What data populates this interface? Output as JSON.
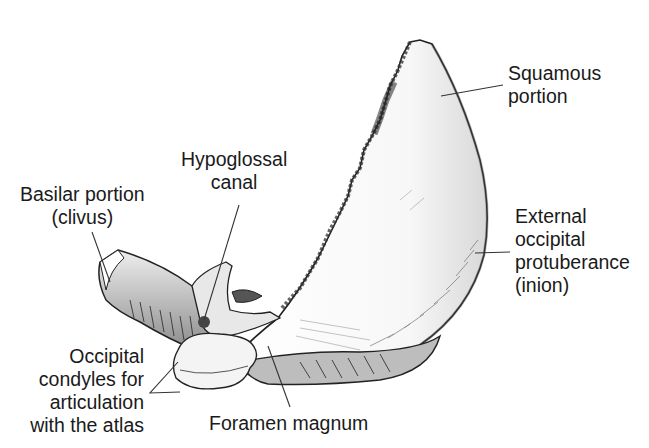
{
  "figure": {
    "labels": {
      "squamous": [
        "Squamous",
        "portion"
      ],
      "hypoglossal": [
        "Hypoglossal",
        "canal"
      ],
      "basilar": [
        "Basilar portion",
        "(clivus)"
      ],
      "external_occipital": [
        "External",
        "occipital",
        "protuberance",
        "(inion)"
      ],
      "condyles": [
        "Occipital",
        "condyles for",
        "articulation",
        "with the atlas"
      ],
      "foramen": [
        "Foramen magnum"
      ]
    },
    "colors": {
      "background": "#ffffff",
      "bone_fill": "#f2f2f2",
      "outline": "#222222",
      "shading": "#6a6a6a",
      "leader_line": "#333333"
    }
  }
}
